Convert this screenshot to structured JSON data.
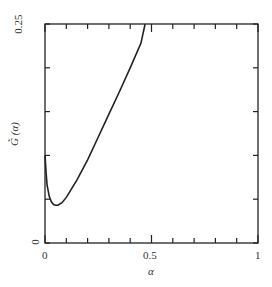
{
  "chart_data": {
    "type": "line",
    "title": "",
    "xlabel": "α",
    "ylabel": "G̃ (α)",
    "xlim": [
      0,
      1
    ],
    "ylim": [
      0,
      0.25
    ],
    "x_tick_labels": [
      "0",
      "0.5",
      "1"
    ],
    "y_tick_labels": [
      "0",
      "0.25"
    ],
    "x_ticks": [
      0,
      0.1,
      0.2,
      0.3,
      0.4,
      0.5,
      0.6,
      0.7,
      0.8,
      0.9,
      1.0
    ],
    "y_ticks": [
      0,
      0.05,
      0.1,
      0.15,
      0.2,
      0.25
    ],
    "grid": false,
    "legend": null,
    "series": [
      {
        "name": "G̃(α)",
        "x": [
          0.0,
          0.005,
          0.01,
          0.02,
          0.03,
          0.04,
          0.05,
          0.06,
          0.08,
          0.1,
          0.12,
          0.15,
          0.2,
          0.25,
          0.3,
          0.35,
          0.4,
          0.45,
          0.47
        ],
        "y": [
          0.1,
          0.08,
          0.066,
          0.053,
          0.047,
          0.044,
          0.043,
          0.043,
          0.046,
          0.052,
          0.06,
          0.072,
          0.095,
          0.121,
          0.147,
          0.173,
          0.2,
          0.228,
          0.25
        ]
      }
    ]
  },
  "axes": {
    "x_label": "α",
    "y_label": "G̃ (α)",
    "x_tick_0": "0",
    "x_tick_mid": "0.5",
    "x_tick_max": "1",
    "y_tick_0": "0",
    "y_tick_max": "0.25"
  }
}
